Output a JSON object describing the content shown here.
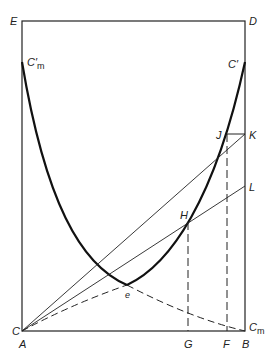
{
  "figure": {
    "type": "geometric-curve-diagram",
    "colors": {
      "line": "#222222",
      "background": "#ffffff"
    }
  },
  "labels": {
    "E": "E",
    "D": "D",
    "C_top_left": "C′",
    "C_top_left_sub": "m",
    "C_top_right": "C′",
    "J": "J",
    "K": "K",
    "L": "L",
    "H": "H",
    "e": "e",
    "C_bottom_left": "C",
    "A": "A",
    "G": "G",
    "F": "F",
    "B": "B",
    "C_bottom_right": "C",
    "C_bottom_right_sub": "m"
  },
  "points": {
    "E": [
      22,
      21
    ],
    "D": [
      245,
      21
    ],
    "A": [
      22,
      331
    ],
    "B": [
      245,
      331
    ],
    "C_prime_m": [
      22,
      62
    ],
    "C_prime": [
      245,
      62
    ],
    "J": [
      227,
      134
    ],
    "K": [
      245,
      134
    ],
    "L": [
      245,
      186
    ],
    "H": [
      188,
      222
    ],
    "e": [
      127,
      285
    ],
    "G": [
      188,
      331
    ],
    "F": [
      227,
      331
    ]
  }
}
